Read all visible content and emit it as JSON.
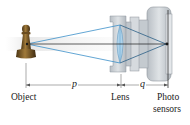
{
  "diagram": {
    "type": "camera-lens-optics",
    "labels": {
      "object": "Object",
      "lens": "Lens",
      "sensor_line1": "Photo",
      "sensor_line2": "sensors"
    },
    "dimensions": {
      "object_distance": "p",
      "image_distance": "q"
    },
    "colors": {
      "ray": "#3b8fc9",
      "axis": "#1a1a1a",
      "lens_fill": "#a9cfe8",
      "camera_body": "#c9ced3",
      "camera_body_dark": "#aeb4ba",
      "pawn": "#7a5a2a"
    }
  }
}
